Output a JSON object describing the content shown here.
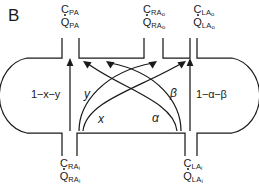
{
  "figure": {
    "panel_letter": "B",
    "type": "compartment-flow-diagram"
  },
  "top_ports": [
    {
      "id": "pa-outlet",
      "conc_symbol": "C",
      "conc_sub": "PA",
      "conc_subsub": "",
      "flow_symbol": "Q",
      "flow_sub": "PA",
      "flow_subsub": "",
      "flow_dotted": true
    },
    {
      "id": "ra-outlet",
      "conc_symbol": "C",
      "conc_sub": "RA",
      "conc_subsub": "o",
      "flow_symbol": "Q",
      "flow_sub": "RA",
      "flow_subsub": "o",
      "flow_dotted": true
    },
    {
      "id": "la-outlet",
      "conc_symbol": "C",
      "conc_sub": "LA",
      "conc_subsub": "o",
      "flow_symbol": "Q",
      "flow_sub": "LA",
      "flow_subsub": "o",
      "flow_dotted": true
    }
  ],
  "bottom_ports": [
    {
      "id": "ra-inlet",
      "conc_symbol": "C",
      "conc_sub": "RA",
      "conc_subsub": "i",
      "flow_symbol": "Q",
      "flow_sub": "RA",
      "flow_subsub": "i",
      "flow_dotted": true
    },
    {
      "id": "la-inlet",
      "conc_symbol": "C",
      "conc_sub": "LA",
      "conc_subsub": "i",
      "flow_symbol": "Q",
      "flow_sub": "LA",
      "flow_subsub": "i",
      "flow_dotted": true
    }
  ],
  "flow_fractions": {
    "left_straight": "1−x−y",
    "right_straight": "1−α−β",
    "left_inner_upper": "y",
    "left_inner_lower": "x",
    "right_inner_upper": "β",
    "right_inner_lower": "α"
  },
  "colors": {
    "stroke": "#1a1a1a",
    "background": "#ffffff",
    "text": "#1a1a1a"
  }
}
